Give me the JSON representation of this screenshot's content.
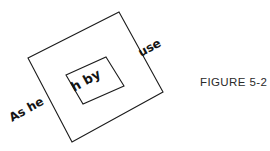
{
  "figure": {
    "caption": "FIGURE 5-2",
    "background_color": "#ffffff",
    "stroke_color": "#1b1b1b",
    "text_color": "#141414",
    "canvas": {
      "width": 270,
      "height": 151
    },
    "outer_shape": {
      "name": "outer-rectangle",
      "rotation_degrees": -29,
      "points": "119,12 163,92 72,142 28,58"
    },
    "inner_shape": {
      "name": "inner-rectangle",
      "rotation_degrees": -29,
      "points": "106,57 124,86 83,104 66,75"
    },
    "labels": [
      {
        "id": "label-as-he",
        "text": "As he",
        "rotation_degrees": -29,
        "x": 12,
        "y": 122,
        "font_size": 12
      },
      {
        "id": "label-use",
        "text": "use",
        "rotation_degrees": -29,
        "x": 141,
        "y": 57,
        "font_size": 12
      },
      {
        "id": "label-h-by",
        "text": "h by",
        "rotation_degrees": -29,
        "x": 74,
        "y": 92,
        "font_size": 13
      }
    ]
  }
}
